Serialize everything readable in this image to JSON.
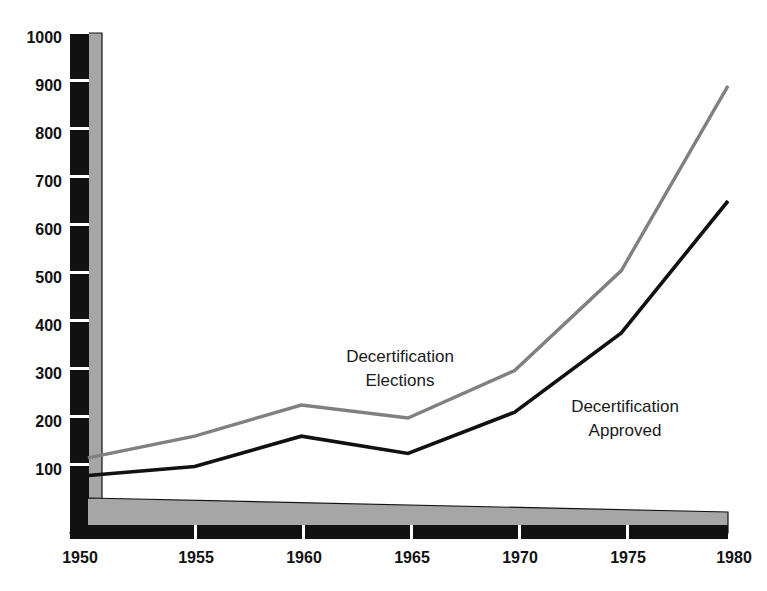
{
  "chart_data": {
    "type": "line",
    "title": "",
    "subtitle": "",
    "xlabel": "",
    "ylabel": "",
    "x": [
      1950,
      1955,
      1960,
      1965,
      1970,
      1975,
      1980
    ],
    "xtick_labels": [
      "1950",
      "1955",
      "1960",
      "1965",
      "1970",
      "1975",
      "1980"
    ],
    "ytick_labels": [
      "100",
      "200",
      "300",
      "400",
      "500",
      "600",
      "700",
      "800",
      "900",
      "1000"
    ],
    "yticks": [
      100,
      200,
      300,
      400,
      500,
      600,
      700,
      800,
      900,
      1000
    ],
    "xlim": [
      1950,
      1980
    ],
    "ylim": [
      0,
      1000
    ],
    "grid": false,
    "legend_position": "inline-annotations",
    "series": [
      {
        "name": "Decertification Elections",
        "color": "#808080",
        "values": [
          115,
          160,
          225,
          198,
          297,
          505,
          890
        ]
      },
      {
        "name": "Decertification Approved",
        "color": "#111111",
        "values": [
          78,
          97,
          160,
          124,
          210,
          375,
          650
        ]
      }
    ],
    "annotations": [
      {
        "id": "elections-label",
        "lines": [
          "Decertification",
          "Elections"
        ],
        "x": 400,
        "y": 362
      },
      {
        "id": "approved-label",
        "lines": [
          "Decertification",
          "Approved"
        ],
        "x": 625,
        "y": 412
      }
    ]
  },
  "axes": {
    "y_axis_name": "y-axis",
    "x_axis_name": "x-axis",
    "axis_bar_color": "#111111",
    "axis_face_color": "#a6a6a6",
    "tick_color": "#ffffff"
  }
}
